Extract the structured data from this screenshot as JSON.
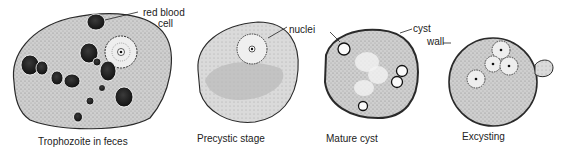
{
  "figure": {
    "stages": [
      {
        "id": "trophozoite",
        "caption": "Trophozoite in feces"
      },
      {
        "id": "precystic",
        "caption": "Precystic stage"
      },
      {
        "id": "mature-cyst",
        "caption": "Mature cyst"
      },
      {
        "id": "excysting",
        "caption": "Excysting"
      }
    ],
    "annotations": {
      "red_blood_cell_line1": "red blood",
      "red_blood_cell_line2": "cell",
      "nuclei": "nuclei",
      "cyst_wall_line1": "cyst",
      "cyst_wall_line2": "wall"
    },
    "colors": {
      "outline": "#2a2a2a",
      "cytoplasm": "#c8c8c8",
      "rbc": "#1e1e1e",
      "nucleus_fill": "#f2f2f2"
    }
  }
}
